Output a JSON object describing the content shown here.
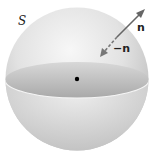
{
  "diagram": {
    "surface_label": "S",
    "outward_normal_label": "n",
    "inward_normal_label": "−n",
    "colors": {
      "sphere_light": "#f2f2f2",
      "sphere_mid": "#d4d4d4",
      "sphere_dark": "#a8a8a8",
      "equator_inner": "#b9b9b9",
      "arrow": "#666666",
      "center_dot": "#000000"
    }
  }
}
